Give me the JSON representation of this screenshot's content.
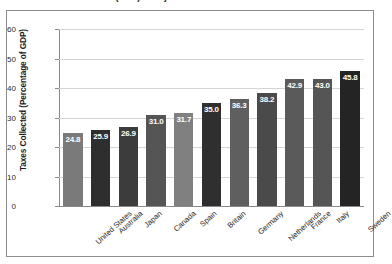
{
  "title": {
    "line_cropped": "(GDP) in Major Industrialized Nations"
  },
  "chart_data": {
    "type": "bar",
    "title": "(GDP) in Major Industrialized Nations",
    "xlabel": "",
    "ylabel": "Taxes Collected (Percentage of GDP)",
    "ylim": [
      0,
      60
    ],
    "yticks": [
      0,
      10,
      20,
      30,
      40,
      50,
      60
    ],
    "grid": true,
    "legend": "none",
    "categories": [
      "United States",
      "Australia",
      "Japan",
      "Canada",
      "Spain",
      "Britain",
      "Germany",
      "Netherlands",
      "France",
      "Italy",
      "Sweden"
    ],
    "values": [
      24.8,
      25.9,
      26.9,
      31.0,
      31.7,
      35.0,
      36.3,
      38.2,
      42.9,
      43.0,
      45.8
    ],
    "value_labels": [
      "24.8",
      "25.9",
      "26.9",
      "31.0",
      "31.7",
      "35.0",
      "36.3",
      "38.2",
      "42.9",
      "43.0",
      "45.8"
    ],
    "bar_colors": [
      "#7a7a7a",
      "#2e2e2e",
      "#3c3c3c",
      "#555555",
      "#808080",
      "#2f2f2f",
      "#5f5f5f",
      "#4a4a4a",
      "#5a5a5a",
      "#555555",
      "#242424"
    ]
  },
  "axis": {
    "y_title": "Taxes Collected (Percentage of GDP)",
    "tick_labels": [
      "60",
      "50",
      "40",
      "30",
      "20",
      "10",
      "0"
    ]
  }
}
